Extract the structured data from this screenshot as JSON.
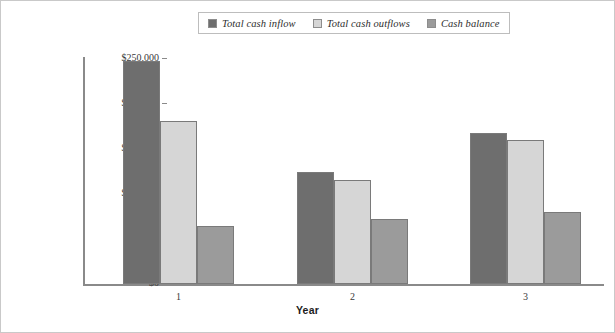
{
  "chart_data": {
    "type": "bar",
    "title": "",
    "subtitle": "",
    "xlabel": "Year",
    "ylabel": "",
    "categories": [
      "1",
      "2",
      "3"
    ],
    "series": [
      {
        "name": "Total cash inflow",
        "color": "#6e6e6e",
        "values": [
          248000,
          124000,
          168000
        ]
      },
      {
        "name": "Total cash outflows",
        "color": "#d6d6d6",
        "values": [
          181000,
          116000,
          160000
        ]
      },
      {
        "name": "Cash balance",
        "color": "#9b9b9b",
        "values": [
          65000,
          72000,
          80000
        ]
      }
    ],
    "ylim": [
      0,
      250000
    ],
    "ytick_values": [
      0,
      50000,
      100000,
      150000,
      200000,
      250000
    ],
    "ytick_labels": [
      "$0",
      "$50,000",
      "$100,000",
      "$150,000",
      "$200,000",
      "$250,000"
    ],
    "grid": false,
    "legend_position": "top-center",
    "currency_prefix": "$"
  },
  "axes": {
    "x_title": "Year",
    "x_tick_labels": [
      "1",
      "2",
      "3"
    ],
    "y_tick_labels": [
      "$250,000",
      "$200,000",
      "$150,000",
      "$100,000",
      "$50,000",
      "$0"
    ]
  },
  "legend": {
    "items": [
      {
        "label": "Total cash inflow",
        "color": "#6e6e6e"
      },
      {
        "label": "Total cash outflows",
        "color": "#d6d6d6"
      },
      {
        "label": "Cash balance",
        "color": "#9b9b9b"
      }
    ]
  }
}
